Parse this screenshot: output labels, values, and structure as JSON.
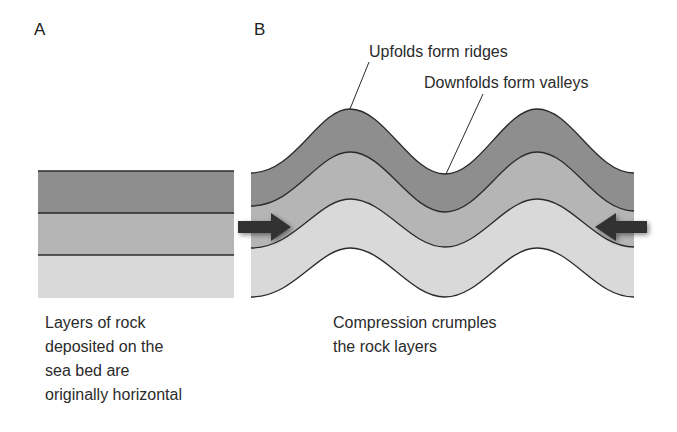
{
  "panels": {
    "a": {
      "label": "A",
      "caption_lines": [
        "Layers of rock",
        "deposited on the",
        "sea bed are",
        "originally horizontal"
      ]
    },
    "b": {
      "label": "B",
      "caption_lines": [
        "Compression crumples",
        "the rock layers"
      ],
      "callouts": {
        "upfolds": "Upfolds form ridges",
        "downfolds": "Downfolds form valleys"
      }
    }
  },
  "colors": {
    "layer_top": "#8e8e8e",
    "layer_middle": "#b5b5b5",
    "layer_bottom": "#d9d9d9",
    "line": "#2a2a2a",
    "arrow": "#333333"
  }
}
